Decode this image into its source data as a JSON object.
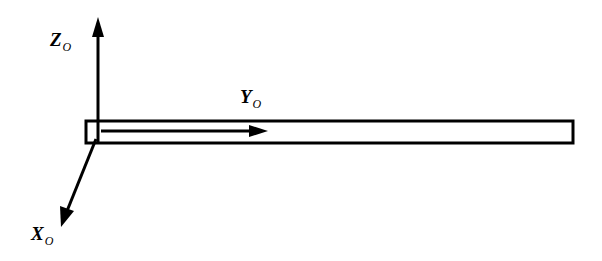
{
  "diagram": {
    "type": "coordinate-frame-with-beam",
    "axes": {
      "z": {
        "main": "Z",
        "subscript": "O"
      },
      "y": {
        "main": "Y",
        "subscript": "O"
      },
      "x": {
        "main": "X",
        "subscript": "O"
      }
    },
    "colors": {
      "stroke": "#000000",
      "background": "#ffffff"
    }
  }
}
